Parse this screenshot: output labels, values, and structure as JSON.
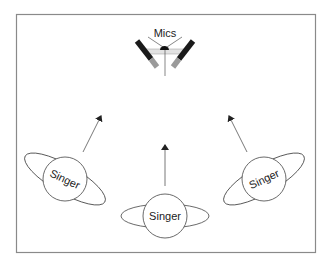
{
  "diagram": {
    "mics_label": "Mics",
    "singers": [
      {
        "label": "Singer",
        "position": "left"
      },
      {
        "label": "Singer",
        "position": "center"
      },
      {
        "label": "Singer",
        "position": "right"
      }
    ],
    "colors": {
      "frame": "#8a8a8a",
      "line": "#555555",
      "mic_body": "#1a1a1a",
      "mic_tip": "#9a9a9a",
      "mic_band": "#e0e0e0"
    }
  }
}
